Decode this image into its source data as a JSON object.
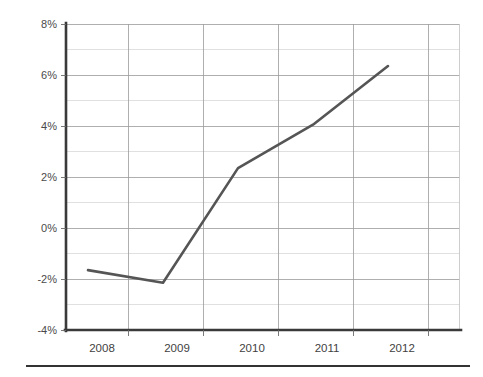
{
  "chart_data": {
    "type": "line",
    "title": "",
    "subtitle": "",
    "xlabel": "",
    "ylabel": "",
    "categories": [
      "2008",
      "2009",
      "2010",
      "2011",
      "2012"
    ],
    "x": [
      2008,
      2009,
      2010,
      2011,
      2012
    ],
    "values": [
      -1.65,
      -2.15,
      2.35,
      4.05,
      6.35
    ],
    "series": [
      {
        "name": "",
        "values": [
          -1.65,
          -2.15,
          2.35,
          4.05,
          6.35
        ]
      }
    ],
    "ylim": [
      -4,
      8
    ],
    "ytick_labels": [
      "8%",
      "6%",
      "4%",
      "2%",
      "0%",
      "-2%",
      "-4%"
    ],
    "ytick_values": [
      8,
      6,
      4,
      2,
      0,
      -2,
      -4
    ],
    "minor_tick_values": [
      7,
      5,
      3,
      1,
      -1,
      -3
    ],
    "xtick_labels": [
      "2008",
      "2009",
      "2010",
      "2011",
      "2012"
    ],
    "grid": true,
    "grid_axis": "both",
    "legend": false,
    "legend_position": "none",
    "annotations": [],
    "colors": {
      "line": "#555555",
      "grid_major": "#9a9a9a",
      "grid_minor": "#d8d8d8",
      "axis": "#3a3a3a",
      "tick_label": "#4a4a4a",
      "background": "#ffffff",
      "footer_rule": "#333333"
    }
  },
  "axes": {
    "y_labels": [
      {
        "text": "8%",
        "value": 8
      },
      {
        "text": "6%",
        "value": 6
      },
      {
        "text": "4%",
        "value": 4
      },
      {
        "text": "2%",
        "value": 2
      },
      {
        "text": "0%",
        "value": 0
      },
      {
        "text": "-2%",
        "value": -2
      },
      {
        "text": "-4%",
        "value": -4
      }
    ],
    "x_labels": [
      {
        "text": "2008"
      },
      {
        "text": "2009"
      },
      {
        "text": "2010"
      },
      {
        "text": "2011"
      },
      {
        "text": "2012"
      }
    ]
  }
}
